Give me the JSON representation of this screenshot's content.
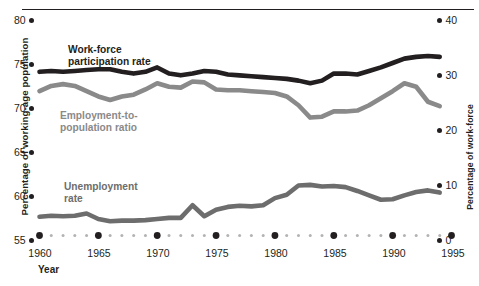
{
  "chart_data": {
    "type": "line",
    "title": "",
    "xlabel": "Year",
    "ylabel": "Percentage of working-age population",
    "ylabel_right": "Percentage of work-force",
    "xlim": [
      1959,
      1995
    ],
    "ylim": [
      55,
      80
    ],
    "ylim_right": [
      0,
      40
    ],
    "yticks": [
      80,
      75,
      70,
      65,
      60,
      55
    ],
    "yticks_right": [
      40,
      30,
      20,
      10,
      0
    ],
    "xticks": [
      1960,
      1965,
      1970,
      1975,
      1980,
      1985,
      1990,
      1995
    ],
    "grid": false,
    "legend": "inline-labels",
    "x": [
      1960,
      1961,
      1962,
      1963,
      1964,
      1965,
      1966,
      1967,
      1968,
      1969,
      1970,
      1971,
      1972,
      1973,
      1974,
      1975,
      1976,
      1977,
      1978,
      1979,
      1980,
      1981,
      1982,
      1983,
      1984,
      1985,
      1986,
      1987,
      1988,
      1989,
      1990,
      1991,
      1992,
      1993,
      1994
    ],
    "series": [
      {
        "name": "Work-force participation rate",
        "axis": "left",
        "color": "#231f20",
        "values": [
          73.6,
          73.7,
          73.6,
          73.7,
          73.8,
          73.9,
          73.9,
          73.6,
          73.4,
          73.6,
          74.1,
          73.4,
          73.2,
          73.4,
          73.7,
          73.6,
          73.3,
          73.2,
          73.1,
          73.0,
          72.9,
          72.8,
          72.6,
          72.3,
          72.6,
          73.4,
          73.4,
          73.3,
          73.7,
          74.1,
          74.6,
          75.1,
          75.3,
          75.4,
          75.3
        ]
      },
      {
        "name": "Employment-to-population ratio",
        "axis": "left",
        "color": "#8a8a8a",
        "values": [
          71.4,
          72.0,
          72.2,
          72.0,
          71.4,
          70.8,
          70.4,
          70.8,
          71.0,
          71.6,
          72.3,
          71.9,
          71.8,
          72.5,
          72.4,
          71.6,
          71.5,
          71.5,
          71.4,
          71.3,
          71.2,
          70.8,
          69.8,
          68.4,
          68.5,
          69.1,
          69.1,
          69.2,
          69.8,
          70.6,
          71.4,
          72.3,
          71.9,
          70.2,
          69.7
        ]
      },
      {
        "name": "Unemployment rate",
        "axis": "right",
        "color": "#6d6d6d",
        "values": [
          3.4,
          3.6,
          3.5,
          3.6,
          4.0,
          3.0,
          2.6,
          2.7,
          2.7,
          2.8,
          3.0,
          3.2,
          3.2,
          5.5,
          3.5,
          4.7,
          5.2,
          5.4,
          5.3,
          5.5,
          6.8,
          7.4,
          9.1,
          9.2,
          8.9,
          9.0,
          8.8,
          8.1,
          7.3,
          6.5,
          6.6,
          7.3,
          7.9,
          8.2,
          7.8
        ]
      }
    ]
  },
  "axes": {
    "left": {
      "label": "Percentage of working-age population",
      "ticks": [
        "80",
        "75",
        "70",
        "65",
        "60",
        "55"
      ]
    },
    "right": {
      "label": "Percentage of work-force",
      "ticks": [
        "40",
        "30",
        "20",
        "10",
        "0"
      ]
    },
    "x": {
      "label": "Year",
      "ticks": [
        "1960",
        "1965",
        "1970",
        "1975",
        "1980",
        "1985",
        "1990",
        "1995"
      ]
    }
  },
  "series_labels": {
    "workforce_participation": "Work-force\nparticipation rate",
    "workforce_participation_line1": "Work-force",
    "workforce_participation_line2": "participation rate",
    "employment_population": "Employment-to-\npopulation ratio",
    "employment_population_line1": "Employment-to-",
    "employment_population_line2": "population ratio",
    "unemployment_line1": "Unemployment",
    "unemployment_line2": "rate"
  },
  "colors": {
    "workforce_participation": "#231f20",
    "employment_population": "#8a8a8a",
    "unemployment": "#6d6d6d",
    "axis_text": "#231f20",
    "baseline_dots": "#b3b3b3"
  }
}
